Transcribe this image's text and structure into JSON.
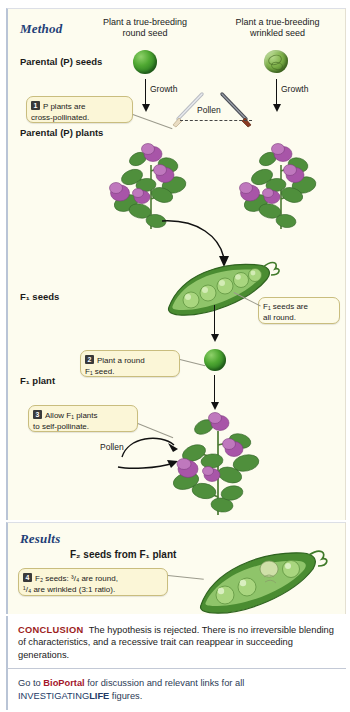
{
  "figure": {
    "method": {
      "heading": "Method",
      "columns": [
        {
          "id": "left",
          "text": "Plant a true-breeding\nround seed"
        },
        {
          "id": "right",
          "text": "Plant a true-breeding\nwrinkled seed"
        }
      ],
      "stages": [
        {
          "id": "p-seeds",
          "label": "Parental (P) seeds"
        },
        {
          "id": "p-plants",
          "label": "Parental (P) plants"
        },
        {
          "id": "f1-seeds",
          "label": "F₁ seeds"
        },
        {
          "id": "f1-plant",
          "label": "F₁  plant"
        }
      ],
      "arrow_labels": [
        {
          "id": "growth-left",
          "text": "Growth"
        },
        {
          "id": "growth-right",
          "text": "Growth"
        },
        {
          "id": "pollen-cross",
          "text": "Pollen"
        },
        {
          "id": "pollen-self",
          "text": "Pollen"
        }
      ],
      "steps": [
        {
          "number": "1",
          "text": "P plants are\ncross-pollinated."
        },
        {
          "number": "2",
          "text": "Plant a round\nF₁ seed."
        },
        {
          "number": "3",
          "text": "Allow F₁ plants\nto self-pollinate."
        }
      ],
      "annotations": [
        {
          "id": "f1-all-round",
          "text": "F₁ seeds are\nall round."
        }
      ]
    },
    "results": {
      "heading": "Results",
      "subheading": "F₂ seeds from F₁ plant",
      "steps": [
        {
          "number": "4",
          "text": "F₂ seeds: ³/₄ are round,\n¹/₄ are wrinkled (3:1 ratio)."
        }
      ]
    },
    "conclusion": {
      "label": "CONCLUSION",
      "text": "The hypothesis is rejected. There is no irreversible blending of characteristics, and a recessive trait can reappear in succeeding generations."
    },
    "bioportal": {
      "line1_pre": "Go to ",
      "brand": "BioPortal",
      "line1_post": " for discussion and relevant links for all",
      "line2_pre": "INVESTIGATING",
      "line2_brand": "LIFE",
      "line2_post": " figures."
    },
    "colors": {
      "panel_bg": "#fdfcef",
      "heading_blue": "#1f3f77",
      "callout_bg": "#fbf6d7",
      "callout_border": "#c9bd7e",
      "conclusion_red": "#9c1c1c",
      "bioportal_red": "#a3172b",
      "navy": "#233a66",
      "seed_green": "#2c7d23",
      "flower_purple": "#a855a8",
      "leaf_green": "#4f8f3c",
      "rule_blue": "#b9c4d6"
    },
    "illustrations": {
      "p_seed_round": "round-pea-seed",
      "p_seed_wrinkled": "wrinkled-pea-seed",
      "p_plant_left": "pea-plant-purple-flowers",
      "p_plant_right": "pea-plant-purple-flowers",
      "f1_pod": "pea-pod-five-round-seeds",
      "f1_seed": "round-pea-seed",
      "f1_plant": "pea-plant-purple-flowers",
      "f2_pod": "pea-pod-three-round-one-wrinkled",
      "tool_left": "pollination-brush",
      "tool_right": "pollination-brush"
    }
  }
}
